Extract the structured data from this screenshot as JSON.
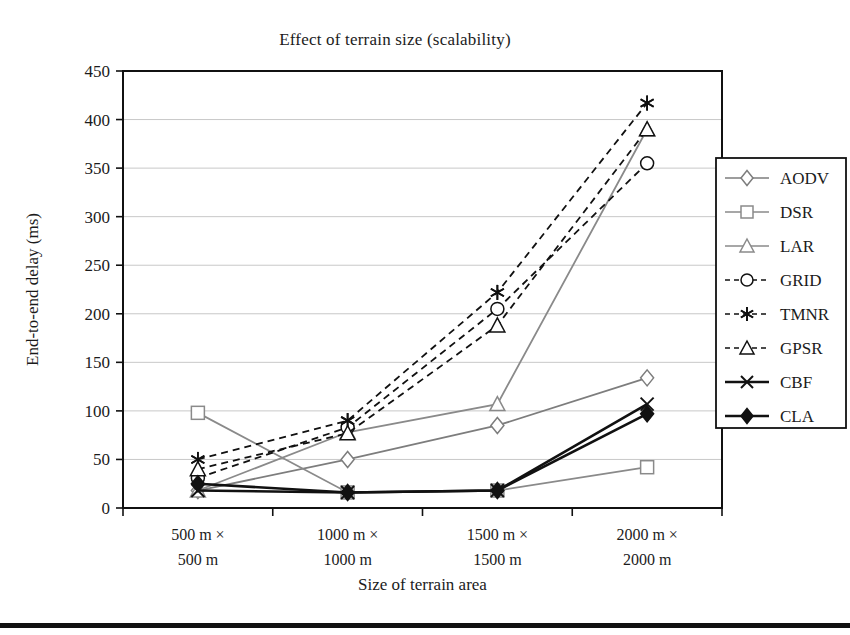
{
  "chart_data": {
    "type": "line",
    "title": "Effect of terrain size (scalability)",
    "xlabel": "Size of terrain area",
    "ylabel": "End-to-end delay (ms)",
    "categories": [
      "500 m × 500 m",
      "1000 m × 1000 m",
      "1500 m × 1500 m",
      "2000 m × 2000 m"
    ],
    "category_lines": [
      [
        "500 m ×",
        "500 m"
      ],
      [
        "1000 m ×",
        "1000 m"
      ],
      [
        "1500 m ×",
        "1500 m"
      ],
      [
        "2000 m ×",
        "2000 m"
      ]
    ],
    "ylim": [
      0,
      450
    ],
    "yticks": [
      0,
      50,
      100,
      150,
      200,
      250,
      300,
      350,
      400,
      450
    ],
    "ytick_labels": [
      "0",
      "50",
      "100",
      "150",
      "200",
      "250",
      "300",
      "350",
      "400",
      "450"
    ],
    "grid": true,
    "legend_position": "right",
    "series": [
      {
        "name": "AODV",
        "values": [
          18,
          50,
          85,
          134
        ],
        "marker": "diamond",
        "color": "#7d7d7d",
        "dash": "solid"
      },
      {
        "name": "DSR",
        "values": [
          98,
          16,
          18,
          42
        ],
        "marker": "square",
        "color": "#8a8a8a",
        "dash": "solid"
      },
      {
        "name": "LAR",
        "values": [
          18,
          78,
          107,
          390
        ],
        "marker": "triangle",
        "color": "#8a8a8a",
        "dash": "solid"
      },
      {
        "name": "GRID",
        "values": [
          31,
          83,
          205,
          355
        ],
        "marker": "circle",
        "color": "#111111",
        "dash": "dashed"
      },
      {
        "name": "TMNR",
        "values": [
          50,
          90,
          222,
          417
        ],
        "marker": "asterisk",
        "color": "#111111",
        "dash": "dashed"
      },
      {
        "name": "GPSR",
        "values": [
          40,
          77,
          188,
          390
        ],
        "marker": "triangle",
        "color": "#111111",
        "dash": "dashed"
      },
      {
        "name": "CBF",
        "values": [
          18,
          16,
          18,
          107
        ],
        "marker": "x",
        "color": "#111111",
        "dash": "solid"
      },
      {
        "name": "CLA",
        "values": [
          25,
          16,
          18,
          97
        ],
        "marker": "diamond-filled",
        "color": "#111111",
        "dash": "solid"
      }
    ]
  },
  "colors": {
    "gray_series": "#8a8a8a",
    "black_series": "#111111",
    "grid": "#c8c8c8",
    "axis": "#111111"
  }
}
